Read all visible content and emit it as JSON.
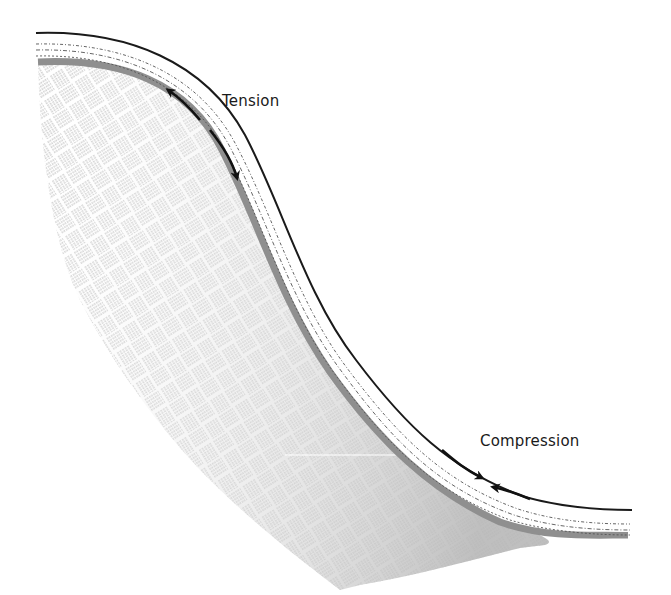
{
  "diagram": {
    "labels": {
      "tension": "Tension",
      "compression": "Compression"
    },
    "colors": {
      "background": "#ffffff",
      "outline": "#1a1a1a",
      "fill_shadow": "#9a9a9a",
      "fill_light": "#e6e6e6",
      "pattern_stroke": "#8c8c8c",
      "arrow": "#111111"
    },
    "arrows": [
      {
        "region": "tension",
        "direction": "up-left",
        "meaning": "pull apart"
      },
      {
        "region": "tension",
        "direction": "down-right",
        "meaning": "pull apart"
      },
      {
        "region": "compression",
        "direction": "down-right",
        "meaning": "push together"
      },
      {
        "region": "compression",
        "direction": "left",
        "meaning": "push together"
      }
    ]
  }
}
